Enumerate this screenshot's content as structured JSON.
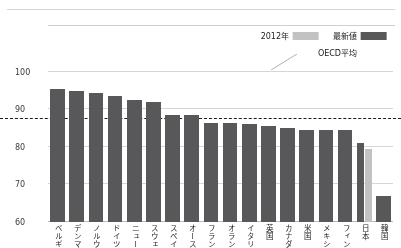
{
  "chart_data": {
    "type": "bar",
    "title": "",
    "subtitle": "",
    "xlabel": "",
    "ylabel": "",
    "ylim": [
      60,
      100
    ],
    "yticks": [
      60,
      70,
      80,
      90,
      100
    ],
    "grid": true,
    "orientation": "vertical-inverted",
    "legend_position": "bottom-left",
    "categories": [
      "韓国",
      "日本",
      "フィンランド",
      "メキシコ",
      "米国",
      "カナダ",
      "英国",
      "イタリア",
      "オランダ",
      "フランス",
      "オーストラリア",
      "スペイン",
      "スウェーデン",
      "ニュージーランド",
      "ドイツ",
      "ノルウェー",
      "デンマーク",
      "ベルギー"
    ],
    "series": [
      {
        "name": "最新値",
        "color": "#58585a",
        "values": [
          67.0,
          81.0,
          84.5,
          84.5,
          84.5,
          85.0,
          85.5,
          86.0,
          86.5,
          86.5,
          88.5,
          88.5,
          92.0,
          92.5,
          93.5,
          94.5,
          95.0,
          95.5
        ]
      },
      {
        "name": "2012年",
        "color": "#c2c2c2",
        "values": [
          null,
          79.5,
          null,
          null,
          null,
          null,
          null,
          null,
          null,
          null,
          null,
          null,
          null,
          null,
          null,
          null,
          null,
          null
        ]
      }
    ],
    "annotations": [
      {
        "label": "OECD平均",
        "type": "reference-line",
        "value": 87.4,
        "style": "dashed",
        "color": "#1a1a1a"
      }
    ]
  },
  "legend": {
    "items": [
      {
        "label": "2012年",
        "swatch": "y2012"
      },
      {
        "label": "最新値",
        "swatch": "latest"
      }
    ]
  },
  "annotation": {
    "oecd_label": "OECD平均"
  }
}
